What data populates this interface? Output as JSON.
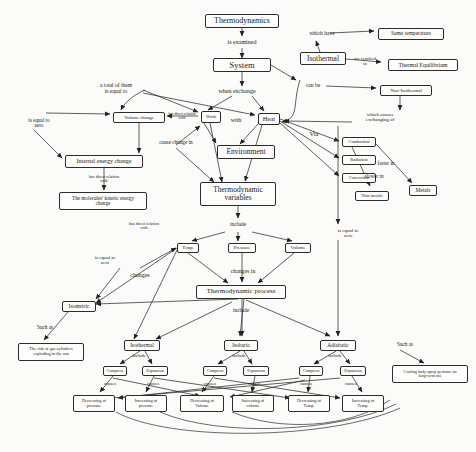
{
  "diagram": {
    "caption": "Fig. 1. Thermodynamics concept map.",
    "nodes": [
      {
        "id": "thermodynamics",
        "label": "Thermodynamics",
        "x": 205,
        "y": 14,
        "w": 74,
        "h": 14,
        "fs": 8
      },
      {
        "id": "system",
        "label": "System",
        "x": 213,
        "y": 58,
        "w": 58,
        "h": 14,
        "fs": 8.5
      },
      {
        "id": "isothermal-top",
        "label": "Isothermal",
        "x": 300,
        "y": 52,
        "w": 46,
        "h": 13,
        "fs": 7.5
      },
      {
        "id": "same-temperature",
        "label": "Same temperature",
        "x": 378,
        "y": 28,
        "w": 66,
        "h": 12,
        "fs": 5.5
      },
      {
        "id": "thermal-equilibrium",
        "label": "Thermal Equilibrium",
        "x": 388,
        "y": 59,
        "w": 70,
        "h": 12,
        "fs": 5.8
      },
      {
        "id": "non-isothermal",
        "label": "Non-Isothermal",
        "x": 380,
        "y": 85,
        "w": 52,
        "h": 11,
        "fs": 5
      },
      {
        "id": "volume-change",
        "label": "Volume change",
        "x": 113,
        "y": 112,
        "w": 52,
        "h": 11,
        "fs": 4.8
      },
      {
        "id": "work",
        "label": "Work",
        "x": 201,
        "y": 111,
        "w": 20,
        "h": 12,
        "fs": 4.5
      },
      {
        "id": "heat",
        "label": "Heat",
        "x": 258,
        "y": 113,
        "w": 22,
        "h": 12,
        "fs": 6.5
      },
      {
        "id": "environment",
        "label": "Environment",
        "x": 217,
        "y": 145,
        "w": 58,
        "h": 14,
        "fs": 7.5
      },
      {
        "id": "internal-energy-change",
        "label": "Internal energy change",
        "x": 65,
        "y": 155,
        "w": 78,
        "h": 13,
        "fs": 6
      },
      {
        "id": "molecules-kinetic",
        "label": "The molecules' kinetic energy\nchange",
        "x": 59,
        "y": 192,
        "w": 88,
        "h": 18,
        "fs": 5.2
      },
      {
        "id": "conduction",
        "label": "Conduction",
        "x": 342,
        "y": 137,
        "w": 34,
        "h": 10,
        "fs": 4.5
      },
      {
        "id": "radiation",
        "label": "Radiation",
        "x": 342,
        "y": 155,
        "w": 34,
        "h": 10,
        "fs": 4.5
      },
      {
        "id": "convection",
        "label": "Convection",
        "x": 342,
        "y": 173,
        "w": 34,
        "h": 10,
        "fs": 4.5
      },
      {
        "id": "non-metals",
        "label": "Non-metals",
        "x": 355,
        "y": 191,
        "w": 34,
        "h": 10,
        "fs": 4.5
      },
      {
        "id": "metals",
        "label": "Metals",
        "x": 409,
        "y": 185,
        "w": 28,
        "h": 11,
        "fs": 5.5
      },
      {
        "id": "thermodynamic-variables",
        "label": "Thermodynamic\nvariables",
        "x": 200,
        "y": 182,
        "w": 76,
        "h": 24,
        "fs": 7.5
      },
      {
        "id": "temp",
        "label": "Temp.",
        "x": 177,
        "y": 243,
        "w": 22,
        "h": 10,
        "fs": 4.6
      },
      {
        "id": "pressure",
        "label": "Pressure",
        "x": 228,
        "y": 243,
        "w": 28,
        "h": 10,
        "fs": 4.8
      },
      {
        "id": "volume",
        "label": "Volume",
        "x": 285,
        "y": 243,
        "w": 26,
        "h": 10,
        "fs": 4.8
      },
      {
        "id": "thermodynamic-process",
        "label": "Thermodynamic process",
        "x": 196,
        "y": 285,
        "w": 90,
        "h": 14,
        "fs": 7
      },
      {
        "id": "isometric",
        "label": "Isometric",
        "x": 62,
        "y": 301,
        "w": 34,
        "h": 11,
        "fs": 5.5
      },
      {
        "id": "isothermal-bottom",
        "label": "Isothermal",
        "x": 124,
        "y": 340,
        "w": 36,
        "h": 11,
        "fs": 5.5
      },
      {
        "id": "isobaric",
        "label": "Isobaric",
        "x": 224,
        "y": 340,
        "w": 34,
        "h": 11,
        "fs": 5.5
      },
      {
        "id": "adiabatic",
        "label": "Adiabatic",
        "x": 320,
        "y": 340,
        "w": 36,
        "h": 11,
        "fs": 5.5
      },
      {
        "id": "gas-cylinder-risk",
        "label": "The risk of gas cylinders\nexploding in the sun",
        "x": 18,
        "y": 343,
        "w": 66,
        "h": 18,
        "fs": 4.4
      },
      {
        "id": "cooling-spray",
        "label": "Cooling body spray perfume on\nlong-term use",
        "x": 392,
        "y": 365,
        "w": 76,
        "h": 18,
        "fs": 4.2
      },
      {
        "id": "compress-iso",
        "label": "Compress",
        "x": 103,
        "y": 366,
        "w": 24,
        "h": 10,
        "fs": 4.2
      },
      {
        "id": "expansion-iso",
        "label": "Expansion",
        "x": 142,
        "y": 366,
        "w": 26,
        "h": 10,
        "fs": 4.2
      },
      {
        "id": "compress-isob",
        "label": "Compress",
        "x": 203,
        "y": 366,
        "w": 24,
        "h": 10,
        "fs": 4.2
      },
      {
        "id": "expansion-isob",
        "label": "Expansion",
        "x": 243,
        "y": 366,
        "w": 26,
        "h": 10,
        "fs": 4.2
      },
      {
        "id": "compress-adia",
        "label": "Compress",
        "x": 299,
        "y": 366,
        "w": 24,
        "h": 10,
        "fs": 4.2
      },
      {
        "id": "expansion-adia",
        "label": "Expansion",
        "x": 340,
        "y": 366,
        "w": 26,
        "h": 10,
        "fs": 4.2
      },
      {
        "id": "dec-pressure",
        "label": "Decreasing of\npressure",
        "x": 73,
        "y": 395,
        "w": 42,
        "h": 17,
        "fs": 4.3
      },
      {
        "id": "inc-pressure",
        "label": "Increasing of\npressure",
        "x": 125,
        "y": 395,
        "w": 42,
        "h": 17,
        "fs": 4.3
      },
      {
        "id": "dec-volume",
        "label": "Decreasing of\nVolume",
        "x": 180,
        "y": 395,
        "w": 44,
        "h": 17,
        "fs": 4.3
      },
      {
        "id": "inc-volume",
        "label": "Increasing of\nvolume",
        "x": 232,
        "y": 395,
        "w": 42,
        "h": 17,
        "fs": 4.3
      },
      {
        "id": "dec-temp",
        "label": "Decreasing of\nTemp.",
        "x": 288,
        "y": 395,
        "w": 42,
        "h": 17,
        "fs": 4.3
      },
      {
        "id": "inc-temp",
        "label": "Increasing of\nTemp.",
        "x": 342,
        "y": 395,
        "w": 42,
        "h": 17,
        "fs": 4.3
      }
    ],
    "edge_labels": [
      {
        "id": "is-examined",
        "label": "is examined",
        "x": 216,
        "y": 39,
        "w": 52,
        "fs": 6
      },
      {
        "id": "which-have",
        "label": "which have",
        "x": 300,
        "y": 31,
        "w": 44,
        "fs": 5.5
      },
      {
        "id": "are-reached-to",
        "label": "are reached\nto",
        "x": 345,
        "y": 56,
        "w": 40,
        "fs": 4.8
      },
      {
        "id": "can-be",
        "label": "can be",
        "x": 300,
        "y": 83,
        "w": 26,
        "fs": 5.5
      },
      {
        "id": "which-causes-exchanging",
        "label": "which causes\nexchanging of",
        "x": 355,
        "y": 112,
        "w": 50,
        "fs": 5
      },
      {
        "id": "when-exchange",
        "label": "when exchange",
        "x": 207,
        "y": 88,
        "w": 60,
        "fs": 6
      },
      {
        "id": "a-total-of-them",
        "label": "a total of them\nis equal to",
        "x": 87,
        "y": 83,
        "w": 58,
        "fs": 5.5
      },
      {
        "id": "has-direct-relation-with-1",
        "label": "has direct relation\nwith",
        "x": 160,
        "y": 112,
        "w": 44,
        "fs": 3.8
      },
      {
        "id": "with",
        "label": "with",
        "x": 228,
        "y": 117,
        "w": 16,
        "fs": 6
      },
      {
        "id": "cause-change-in",
        "label": "cause change in",
        "x": 148,
        "y": 140,
        "w": 56,
        "fs": 5.3
      },
      {
        "id": "is-equal-to-zero-left",
        "label": "is equal to\nzero",
        "x": 18,
        "y": 118,
        "w": 42,
        "fs": 5.2
      },
      {
        "id": "has-direct-relation-with-2",
        "label": "has direct relation\nwith",
        "x": 80,
        "y": 175,
        "w": 48,
        "fs": 4.2
      },
      {
        "id": "has-direct-relation-with-3",
        "label": "has direct relation\nwith",
        "x": 120,
        "y": 222,
        "w": 48,
        "fs": 4.2
      },
      {
        "id": "via",
        "label": "Via",
        "x": 306,
        "y": 131,
        "w": 16,
        "fs": 6.5
      },
      {
        "id": "faster-in",
        "label": "faster in",
        "x": 370,
        "y": 161,
        "w": 32,
        "fs": 5.2
      },
      {
        "id": "slower-in",
        "label": "slower in",
        "x": 358,
        "y": 174,
        "w": 32,
        "fs": 5.2
      },
      {
        "id": "include-variables",
        "label": "include",
        "x": 224,
        "y": 222,
        "w": 28,
        "fs": 5.5
      },
      {
        "id": "is-equal-to-zero-right",
        "label": "is equal to\nzero",
        "x": 327,
        "y": 228,
        "w": 42,
        "fs": 5
      },
      {
        "id": "is-equal-to-zero-mid",
        "label": "is equal to\nzero",
        "x": 84,
        "y": 255,
        "w": 42,
        "fs": 5
      },
      {
        "id": "changes",
        "label": "changes",
        "x": 123,
        "y": 272,
        "w": 34,
        "fs": 6
      },
      {
        "id": "changes-in",
        "label": "changes in",
        "x": 222,
        "y": 268,
        "w": 42,
        "fs": 5.8
      },
      {
        "id": "include-process",
        "label": "include",
        "x": 227,
        "y": 308,
        "w": 28,
        "fs": 5.5
      },
      {
        "id": "such-as-left",
        "label": "Such as",
        "x": 30,
        "y": 325,
        "w": 30,
        "fs": 5.2
      },
      {
        "id": "such-as-right",
        "label": "Such as",
        "x": 390,
        "y": 342,
        "w": 30,
        "fs": 5.2
      },
      {
        "id": "include-iso",
        "label": "include",
        "x": 126,
        "y": 354,
        "w": 26,
        "fs": 4.6
      },
      {
        "id": "include-isob",
        "label": "include",
        "x": 226,
        "y": 354,
        "w": 26,
        "fs": 4.6
      },
      {
        "id": "include-adia",
        "label": "include",
        "x": 322,
        "y": 354,
        "w": 26,
        "fs": 4.6
      },
      {
        "id": "causes-1",
        "label": "causes",
        "x": 98,
        "y": 382,
        "w": 24,
        "fs": 4.6
      },
      {
        "id": "causes-2",
        "label": "causes",
        "x": 141,
        "y": 382,
        "w": 24,
        "fs": 4.6
      },
      {
        "id": "causes-3",
        "label": "causes",
        "x": 198,
        "y": 382,
        "w": 24,
        "fs": 4.6
      },
      {
        "id": "causes-4",
        "label": "causes",
        "x": 242,
        "y": 382,
        "w": 24,
        "fs": 4.6
      },
      {
        "id": "causes-5",
        "label": "causes",
        "x": 294,
        "y": 382,
        "w": 24,
        "fs": 4.6
      },
      {
        "id": "causes-6",
        "label": "causes",
        "x": 339,
        "y": 382,
        "w": 24,
        "fs": 4.6
      }
    ]
  }
}
